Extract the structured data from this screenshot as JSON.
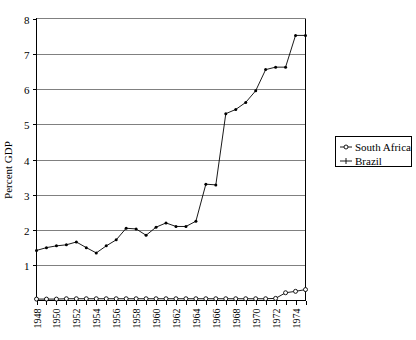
{
  "chart_data": {
    "type": "line",
    "title": "",
    "xlabel": "",
    "ylabel": "Percent GDP",
    "xlim": [
      1948,
      1975
    ],
    "ylim": [
      0,
      8
    ],
    "grid": true,
    "legend_position": "right",
    "x": [
      1948,
      1949,
      1950,
      1951,
      1952,
      1953,
      1954,
      1955,
      1956,
      1957,
      1958,
      1959,
      1960,
      1961,
      1962,
      1963,
      1964,
      1965,
      1966,
      1967,
      1968,
      1969,
      1970,
      1971,
      1972,
      1973,
      1974,
      1975
    ],
    "xtick_labels": [
      "1948",
      "1950",
      "1952",
      "1954",
      "1956",
      "1958",
      "1960",
      "1962",
      "1964",
      "1966",
      "1968",
      "1970",
      "1972",
      "1974"
    ],
    "ytick_labels": [
      "1",
      "2",
      "3",
      "4",
      "5",
      "6",
      "7",
      "8"
    ],
    "ytick_values": [
      1,
      2,
      3,
      4,
      5,
      6,
      7,
      8
    ],
    "series": [
      {
        "name": "South Africa",
        "marker": "open-circle",
        "values": [
          0.04,
          0.04,
          0.04,
          0.05,
          0.05,
          0.05,
          0.05,
          0.05,
          0.05,
          0.05,
          0.05,
          0.05,
          0.05,
          0.05,
          0.05,
          0.05,
          0.05,
          0.05,
          0.05,
          0.05,
          0.05,
          0.05,
          0.05,
          0.05,
          0.06,
          0.22,
          0.26,
          0.31
        ]
      },
      {
        "name": "Brazil",
        "marker": "filled-dot",
        "values": [
          1.42,
          1.5,
          1.55,
          1.58,
          1.66,
          1.5,
          1.35,
          1.55,
          1.72,
          2.05,
          2.03,
          1.85,
          2.08,
          2.2,
          2.1,
          2.1,
          2.25,
          3.3,
          3.28,
          5.3,
          5.42,
          5.62,
          5.95,
          6.55,
          6.62,
          6.62,
          7.52,
          7.52
        ]
      }
    ]
  },
  "legend": {
    "entries": [
      {
        "label": "South Africa",
        "marker": "open-circle"
      },
      {
        "label": "Brazil",
        "marker": "plus"
      }
    ]
  },
  "axes": {
    "y_title": "Percent GDP"
  }
}
